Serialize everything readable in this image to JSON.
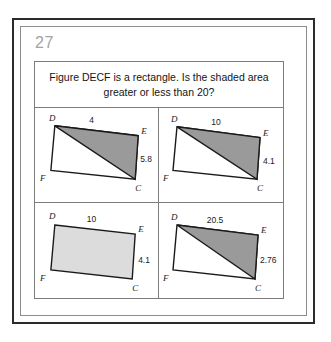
{
  "worksheet": {
    "question_number": "27",
    "prompt": "Figure DECF is a rectangle. Is the shaded area greater or less than 20?",
    "colors": {
      "frame_outer": "#2b2b2b",
      "frame_inner": "#8c8c8c",
      "card_border": "#7d7d7d",
      "shape_outline": "#1a1a1a",
      "shaded_triangle": "#9a9a9a",
      "shaded_rectangle": "#dcdcdc",
      "unshaded": "#ffffff",
      "question_number_color": "#a3a3a3",
      "text": "#141414",
      "page_background": "#ffffff"
    }
  },
  "figures": [
    {
      "id": "figure-top-left",
      "position": "top-left",
      "vertices": {
        "D": "D",
        "E": "E",
        "F": "F",
        "C": "C"
      },
      "top_measure": "4",
      "side_measure": "5.8",
      "shaded_region": "triangle-DEC",
      "shade_style": "medium-gray"
    },
    {
      "id": "figure-top-right",
      "position": "top-right",
      "vertices": {
        "D": "D",
        "E": "E",
        "F": "F",
        "C": "C"
      },
      "top_measure": "10",
      "side_measure": "4.1",
      "shaded_region": "triangle-DEC",
      "shade_style": "medium-gray"
    },
    {
      "id": "figure-bottom-left",
      "position": "bottom-left",
      "vertices": {
        "D": "D",
        "E": "E",
        "F": "F",
        "C": "C"
      },
      "top_measure": "10",
      "side_measure": "4.1",
      "shaded_region": "rectangle-DECF",
      "shade_style": "light-gray"
    },
    {
      "id": "figure-bottom-right",
      "position": "bottom-right",
      "vertices": {
        "D": "D",
        "E": "E",
        "F": "F",
        "C": "C"
      },
      "top_measure": "20.5",
      "side_measure": "2.76",
      "shaded_region": "triangle-DEC",
      "shade_style": "medium-gray"
    }
  ]
}
